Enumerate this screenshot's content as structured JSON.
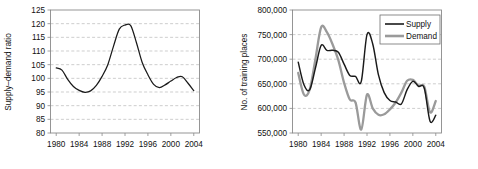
{
  "figure": {
    "background": "#ffffff",
    "panels": [
      "left",
      "right"
    ]
  },
  "chart_data": [
    {
      "id": "supply-demand-ratio",
      "type": "line",
      "title": "",
      "xlabel": "",
      "ylabel": "Supply–demand ratio",
      "xlim": [
        1979,
        2005
      ],
      "ylim": [
        80,
        125
      ],
      "xticks": [
        1980,
        1984,
        1988,
        1992,
        1996,
        2000,
        2004
      ],
      "xtick_labels": [
        "1980",
        "1984",
        "1988",
        "1992",
        "1996",
        "2000",
        "2004"
      ],
      "yticks": [
        80,
        85,
        90,
        95,
        100,
        105,
        110,
        115,
        120,
        125
      ],
      "ytick_labels": [
        "80",
        "85",
        "90",
        "95",
        "100",
        "105",
        "110",
        "115",
        "120",
        "125"
      ],
      "grid": "horizontal-dashed",
      "legend": "none",
      "line_color": "#1a1a1a",
      "x": [
        1980,
        1981,
        1982,
        1983,
        1984,
        1985,
        1986,
        1987,
        1988,
        1989,
        1990,
        1991,
        1992,
        1993,
        1994,
        1995,
        1996,
        1997,
        1998,
        1999,
        2000,
        2001,
        2002,
        2003,
        2004
      ],
      "values": [
        103.8,
        103.0,
        99.6,
        97.0,
        95.6,
        94.9,
        95.4,
        97.4,
        100.7,
        105.0,
        111.8,
        118.0,
        119.5,
        119.3,
        113.0,
        105.8,
        101.3,
        97.8,
        96.6,
        97.6,
        99.0,
        100.3,
        100.6,
        98.2,
        95.5
      ]
    },
    {
      "id": "training-places",
      "type": "line",
      "title": "",
      "xlabel": "",
      "ylabel": "No. of training places",
      "xlim": [
        1979,
        2005
      ],
      "ylim": [
        550000,
        800000
      ],
      "xticks": [
        1980,
        1984,
        1988,
        1992,
        1996,
        2000,
        2004
      ],
      "xtick_labels": [
        "1980",
        "1984",
        "1988",
        "1992",
        "1996",
        "2000",
        "2004"
      ],
      "yticks": [
        550000,
        600000,
        650000,
        700000,
        750000,
        800000
      ],
      "ytick_labels": [
        "550,000",
        "600,000",
        "650,000",
        "700,000",
        "750,000",
        "800,000"
      ],
      "grid": "horizontal-dashed",
      "legend": "top-right",
      "x": [
        1980,
        1981,
        1982,
        1983,
        1984,
        1985,
        1986,
        1987,
        1988,
        1989,
        1990,
        1991,
        1992,
        1993,
        1994,
        1995,
        1996,
        1997,
        1998,
        1999,
        2000,
        2001,
        2002,
        2003,
        2004
      ],
      "series": [
        {
          "name": "Supply",
          "color": "#1a1a1a",
          "values": [
            694000,
            648000,
            638000,
            682000,
            728000,
            718000,
            718000,
            714000,
            690000,
            667000,
            665000,
            655000,
            750000,
            731000,
            668000,
            632000,
            616000,
            613000,
            609000,
            638000,
            655000,
            645000,
            641000,
            574000,
            586000
          ]
        },
        {
          "name": "Demand",
          "color": "#9a9a9a",
          "values": [
            672000,
            628000,
            638000,
            700000,
            765000,
            755000,
            730000,
            698000,
            652000,
            618000,
            612000,
            557000,
            628000,
            600000,
            587000,
            588000,
            598000,
            612000,
            632000,
            656000,
            658000,
            646000,
            644000,
            592000,
            615000
          ]
        }
      ]
    }
  ],
  "left_panel": {
    "ylabel": "Supply–demand ratio",
    "ytick_labels": [
      "125",
      "120",
      "115",
      "110",
      "105",
      "100",
      "95",
      "90",
      "85",
      "80"
    ],
    "xtick_labels": [
      "1980",
      "1984",
      "1988",
      "1992",
      "1996",
      "2000",
      "2004"
    ]
  },
  "right_panel": {
    "ylabel": "No. of training places",
    "ytick_labels": [
      "800,000",
      "750,000",
      "700,000",
      "650,000",
      "600,000",
      "550,000"
    ],
    "xtick_labels": [
      "1980",
      "1984",
      "1988",
      "1992",
      "1996",
      "2000",
      "2004"
    ],
    "legend": {
      "items": [
        {
          "label": "Supply",
          "color": "#1a1a1a"
        },
        {
          "label": "Demand",
          "color": "#9a9a9a"
        }
      ]
    }
  }
}
